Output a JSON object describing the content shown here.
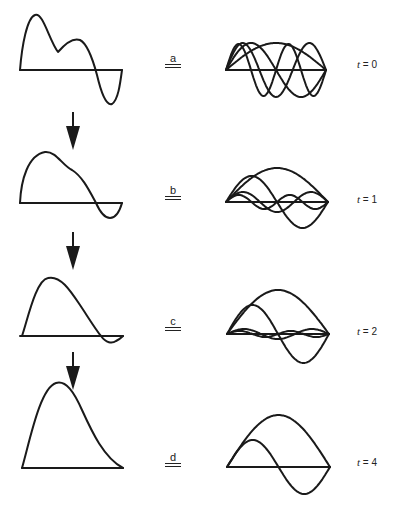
{
  "figure": {
    "rows": [
      {
        "label": "a",
        "time_label": "t = 0",
        "t_var": "t",
        "t_value": "0",
        "modes": [
          {
            "n": 1,
            "amp": 27
          },
          {
            "n": 2,
            "amp": 27
          },
          {
            "n": 3,
            "amp": 27
          },
          {
            "n": 4,
            "amp": 26
          }
        ]
      },
      {
        "label": "b",
        "time_label": "t = 1",
        "t_var": "t",
        "t_value": "1",
        "modes": [
          {
            "n": 1,
            "amp": 34
          },
          {
            "n": 2,
            "amp": 26
          },
          {
            "n": 3,
            "amp": 10
          },
          {
            "n": 4,
            "amp": 7
          }
        ]
      },
      {
        "label": "c",
        "time_label": "t = 2",
        "t_var": "t",
        "t_value": "2",
        "modes": [
          {
            "n": 1,
            "amp": 44
          },
          {
            "n": 2,
            "amp": 29
          },
          {
            "n": 3,
            "amp": 5
          },
          {
            "n": 4,
            "amp": 3
          }
        ]
      },
      {
        "label": "d",
        "time_label": "t = 4",
        "t_var": "t",
        "t_value": "4",
        "modes": [
          {
            "n": 1,
            "amp": 52
          },
          {
            "n": 2,
            "amp": 27
          }
        ]
      }
    ],
    "equals_symbol": "=",
    "arrow_count": 3
  }
}
